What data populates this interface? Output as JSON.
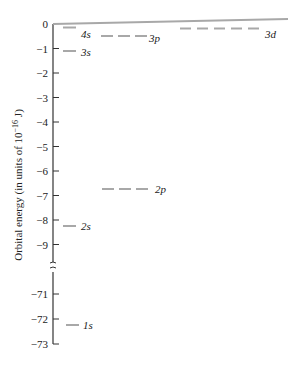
{
  "diagram": {
    "type": "energy-level-diagram",
    "y_axis_label": "Orbital energy (in units of 10",
    "y_axis_exp": "−16",
    "y_axis_unit": " J)",
    "ticks_upper": [
      "0",
      "−1",
      "−2",
      "−3",
      "−4",
      "−5",
      "−6",
      "−7",
      "−8",
      "−9"
    ],
    "ticks_lower": [
      "−71",
      "−72",
      "−73"
    ],
    "axis_break": true,
    "line_color": "#a8a8a8",
    "levels": [
      {
        "label": "4s",
        "energy": -0.15,
        "degeneracy": 1
      },
      {
        "label": "3s",
        "energy": -1.1,
        "degeneracy": 1
      },
      {
        "label": "3p",
        "energy": -0.55,
        "degeneracy": 3
      },
      {
        "label": "3d",
        "energy": -0.2,
        "degeneracy": 5
      },
      {
        "label": "2p",
        "energy": -6.7,
        "degeneracy": 3
      },
      {
        "label": "2s",
        "energy": -8.2,
        "degeneracy": 1
      },
      {
        "label": "1s",
        "energy": -72.2,
        "degeneracy": 1
      }
    ]
  }
}
